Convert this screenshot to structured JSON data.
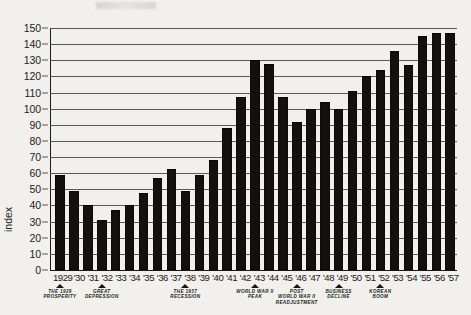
{
  "chart_data": {
    "type": "bar",
    "title": "",
    "xlabel": "",
    "ylabel": "index",
    "ylim": [
      0,
      150
    ],
    "ytick_step": 10,
    "grid": true,
    "legend": null,
    "categories": [
      "1929",
      "'30",
      "'31",
      "'32",
      "'33",
      "'34",
      "'35",
      "'36",
      "'37",
      "'38",
      "'39",
      "'40",
      "'41",
      "'42",
      "'43",
      "'44",
      "'45",
      "'46",
      "'47",
      "'48",
      "'49",
      "'50",
      "'51",
      "'52",
      "'53",
      "'54",
      "'55",
      "'56",
      "'57"
    ],
    "values": [
      59,
      49,
      40,
      31,
      37.5,
      40.5,
      47.5,
      57,
      62.5,
      49,
      59,
      68.5,
      88,
      107,
      130,
      128,
      107,
      92,
      100,
      104,
      99.5,
      111,
      120,
      124,
      136,
      127,
      145,
      147,
      147
    ],
    "yticks": [
      0,
      10,
      20,
      30,
      40,
      50,
      60,
      70,
      80,
      90,
      100,
      110,
      120,
      130,
      140,
      150
    ],
    "annotations": [
      {
        "label": "THE 1929\nPROSPERITY",
        "category": "1929"
      },
      {
        "label": "GREAT\nDEPRESSION",
        "category": "'32"
      },
      {
        "label": "THE 1937\nRECESSION",
        "category": "'38"
      },
      {
        "label": "WORLD WAR II\nPEAK",
        "category": "'43"
      },
      {
        "label": "POST\nWORLD WAR II\nREADJUSTMENT",
        "category": "'46"
      },
      {
        "label": "BUSINESS\nDECLINE",
        "category": "'49"
      },
      {
        "label": "KOREAN\nBOOM",
        "category": "'52"
      }
    ],
    "colors": {
      "bar": "#121110",
      "grid": "#5b5853",
      "axis": "#1c1a18",
      "background": "#f2f0ec",
      "text": "#22201e"
    }
  }
}
